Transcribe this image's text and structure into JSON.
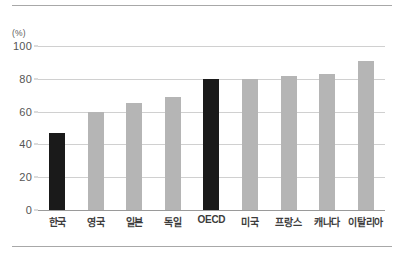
{
  "chart_data": {
    "type": "bar",
    "title": "",
    "subtitle": "",
    "xlabel": "",
    "ylabel": "",
    "unit_label": "(%)",
    "categories": [
      "한국",
      "영국",
      "일본",
      "독일",
      "OECD",
      "미국",
      "프랑스",
      "캐나다",
      "이탈리아"
    ],
    "values": [
      47,
      60,
      65,
      69,
      80,
      80,
      82,
      83,
      91
    ],
    "highlight_indices": [
      0,
      4
    ],
    "ylim": [
      0,
      100
    ],
    "yticks": [
      0,
      20,
      40,
      60,
      80,
      100
    ],
    "ytick_labels": [
      "0",
      "20",
      "40",
      "60",
      "80",
      "100"
    ],
    "grid": true,
    "legend": "none",
    "colors": {
      "bar_default": "#b5b5b5",
      "bar_highlight": "#1a1a1a",
      "gridline": "#d0d0d0",
      "axis": "#9a9a9a",
      "rule": "#a8a8a8",
      "tick_text": "#555555",
      "category_text": "#3c3c3c"
    }
  }
}
